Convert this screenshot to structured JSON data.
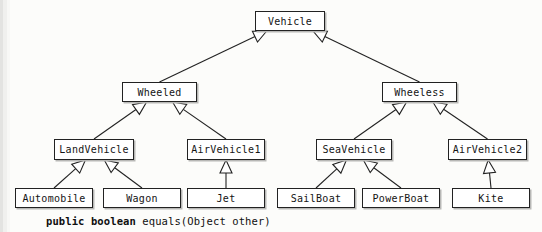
{
  "diagram": {
    "type": "uml-class-inheritance",
    "nodes": [
      {
        "id": "vehicle",
        "label": "Vehicle",
        "level": 1,
        "x": 255,
        "y": 11,
        "w": 70,
        "h": 20
      },
      {
        "id": "wheeled",
        "label": "Wheeled",
        "level": 2,
        "x": 122,
        "y": 82,
        "w": 75,
        "h": 20
      },
      {
        "id": "wheeless",
        "label": "Wheeless",
        "level": 2,
        "x": 382,
        "y": 82,
        "w": 75,
        "h": 20
      },
      {
        "id": "landvehicle",
        "label": "LandVehicle",
        "level": 3,
        "x": 54,
        "y": 139,
        "w": 80,
        "h": 21
      },
      {
        "id": "airvehicle1",
        "label": "AirVehicle1",
        "level": 3,
        "x": 187,
        "y": 139,
        "w": 78,
        "h": 21
      },
      {
        "id": "seavehicle",
        "label": "SeaVehicle",
        "level": 3,
        "x": 316,
        "y": 139,
        "w": 76,
        "h": 21
      },
      {
        "id": "airvehicle2",
        "label": "AirVehicle2",
        "level": 3,
        "x": 448,
        "y": 139,
        "w": 79,
        "h": 21
      },
      {
        "id": "automobile",
        "label": "Automobile",
        "level": 4,
        "x": 15,
        "y": 188,
        "w": 78,
        "h": 20
      },
      {
        "id": "wagon",
        "label": "Wagon",
        "level": 4,
        "x": 103,
        "y": 188,
        "w": 78,
        "h": 20
      },
      {
        "id": "jet",
        "label": "Jet",
        "level": 4,
        "x": 187,
        "y": 188,
        "w": 78,
        "h": 20
      },
      {
        "id": "sailboat",
        "label": "SailBoat",
        "level": 4,
        "x": 277,
        "y": 188,
        "w": 78,
        "h": 20
      },
      {
        "id": "powerboat",
        "label": "PowerBoat",
        "level": 4,
        "x": 362,
        "y": 188,
        "w": 78,
        "h": 20
      },
      {
        "id": "kite",
        "label": "Kite",
        "level": 4,
        "x": 452,
        "y": 188,
        "w": 78,
        "h": 20
      }
    ],
    "edges": [
      {
        "from": "wheeled",
        "to": "vehicle"
      },
      {
        "from": "wheeless",
        "to": "vehicle"
      },
      {
        "from": "landvehicle",
        "to": "wheeled"
      },
      {
        "from": "airvehicle1",
        "to": "wheeled"
      },
      {
        "from": "seavehicle",
        "to": "wheeless"
      },
      {
        "from": "airvehicle2",
        "to": "wheeless"
      },
      {
        "from": "automobile",
        "to": "landvehicle"
      },
      {
        "from": "wagon",
        "to": "landvehicle"
      },
      {
        "from": "jet",
        "to": "airvehicle1"
      },
      {
        "from": "sailboat",
        "to": "seavehicle"
      },
      {
        "from": "powerboat",
        "to": "seavehicle"
      },
      {
        "from": "kite",
        "to": "airvehicle2"
      }
    ],
    "colors": {
      "box_border": "#222222",
      "box_fill": "#ffffff",
      "line": "#222222",
      "arrowhead_fill": "#ffffff",
      "page_background": "#fcfcfa",
      "text": "#141414"
    }
  },
  "caption": {
    "keyword": "public boolean",
    "rest": " equals(Object other)"
  }
}
